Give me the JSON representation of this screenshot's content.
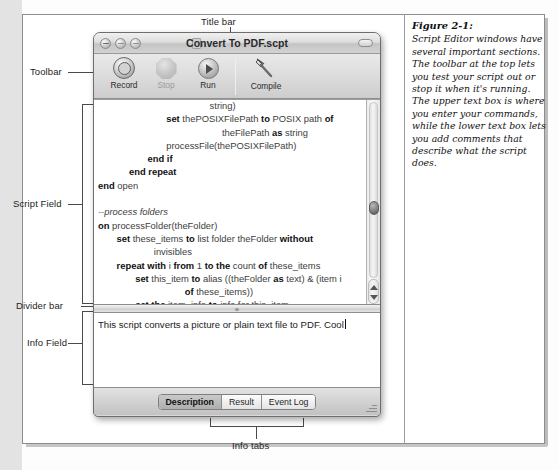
{
  "figure": {
    "number": "Figure 2-1:",
    "caption": "Script Editor windows have several important sections. The toolbar at the top lets you test your script out or stop it when it's running. The upper text box is where you enter your commands, while the lower text box lets you add comments that describe what the script does."
  },
  "annotations": {
    "title_bar": "Title bar",
    "toolbar": "Toolbar",
    "script_field": "Script Field",
    "divider_bar": "Divider bar",
    "info_field": "Info Field",
    "info_tabs": "Info tabs"
  },
  "window": {
    "title": "Convert To PDF.scpt",
    "traffic_lights": [
      "close-button",
      "minimize-button",
      "zoom-button"
    ],
    "proxy_icon": "document-icon",
    "toolbar_toggle": "toolbar-toggle-pill"
  },
  "toolbar": {
    "items": [
      {
        "label": "Record",
        "icon": "record-icon",
        "enabled": true
      },
      {
        "label": "Stop",
        "icon": "stop-icon",
        "enabled": false
      },
      {
        "label": "Run",
        "icon": "run-icon",
        "enabled": true
      },
      {
        "label": "Compile",
        "icon": "hammer-icon",
        "enabled": true
      }
    ]
  },
  "script_field": {
    "lines": [
      {
        "indent": 18,
        "parts": [
          {
            "t": "string)",
            "b": false
          }
        ]
      },
      {
        "indent": 11,
        "parts": [
          {
            "t": "set ",
            "b": true
          },
          {
            "t": "thePOSIXFilePath ",
            "b": false
          },
          {
            "t": "to ",
            "b": true
          },
          {
            "t": "POSIX path ",
            "b": false
          },
          {
            "t": "of",
            "b": true
          }
        ]
      },
      {
        "indent": 20,
        "parts": [
          {
            "t": "theFilePath ",
            "b": false
          },
          {
            "t": "as ",
            "b": true
          },
          {
            "t": "string",
            "b": false
          }
        ]
      },
      {
        "indent": 11,
        "parts": [
          {
            "t": "processFile(thePOSIXFilePath)",
            "b": false
          }
        ]
      },
      {
        "indent": 8,
        "parts": [
          {
            "t": "end if",
            "b": true
          }
        ]
      },
      {
        "indent": 5,
        "parts": [
          {
            "t": "end repeat",
            "b": true
          }
        ]
      },
      {
        "indent": 0,
        "parts": [
          {
            "t": "end ",
            "b": true
          },
          {
            "t": "open",
            "b": false
          }
        ]
      },
      {
        "indent": 0,
        "parts": [
          {
            "t": "",
            "b": false
          }
        ]
      },
      {
        "indent": 0,
        "parts": [
          {
            "t": "--process folders",
            "b": false,
            "i": true
          }
        ]
      },
      {
        "indent": 0,
        "parts": [
          {
            "t": "on ",
            "b": true
          },
          {
            "t": "processFolder(theFolder)",
            "b": false
          }
        ]
      },
      {
        "indent": 3,
        "parts": [
          {
            "t": "set ",
            "b": true
          },
          {
            "t": "these_items ",
            "b": false
          },
          {
            "t": "to ",
            "b": true
          },
          {
            "t": "list folder theFolder ",
            "b": false
          },
          {
            "t": "without",
            "b": true
          }
        ]
      },
      {
        "indent": 9,
        "parts": [
          {
            "t": "invisibles",
            "b": false
          }
        ]
      },
      {
        "indent": 3,
        "parts": [
          {
            "t": "repeat with ",
            "b": true
          },
          {
            "t": "i ",
            "b": false
          },
          {
            "t": "from ",
            "b": true
          },
          {
            "t": "1 ",
            "b": false
          },
          {
            "t": "to the ",
            "b": true
          },
          {
            "t": "count ",
            "b": false
          },
          {
            "t": "of ",
            "b": true
          },
          {
            "t": "these_items",
            "b": false
          }
        ]
      },
      {
        "indent": 6,
        "parts": [
          {
            "t": "set ",
            "b": true
          },
          {
            "t": "this_item ",
            "b": false
          },
          {
            "t": "to ",
            "b": true
          },
          {
            "t": "alias ((theFolder ",
            "b": false
          },
          {
            "t": "as ",
            "b": true
          },
          {
            "t": "text) & (item i",
            "b": false
          }
        ]
      },
      {
        "indent": 14,
        "parts": [
          {
            "t": "of ",
            "b": true
          },
          {
            "t": "these_items))",
            "b": false
          }
        ]
      },
      {
        "indent": 6,
        "parts": [
          {
            "t": "set the ",
            "b": true
          },
          {
            "t": "item_info ",
            "b": false
          },
          {
            "t": "to ",
            "b": true
          },
          {
            "t": "info for this_item",
            "b": false
          }
        ]
      }
    ],
    "scrollbar": {
      "thumb_position_percent": 62
    }
  },
  "info_field": {
    "text": "This script converts a picture or plain text file to PDF. Cool",
    "caret_visible": true
  },
  "tabs": {
    "items": [
      {
        "label": "Description",
        "active": true
      },
      {
        "label": "Result",
        "active": false
      },
      {
        "label": "Event Log",
        "active": false
      }
    ]
  }
}
